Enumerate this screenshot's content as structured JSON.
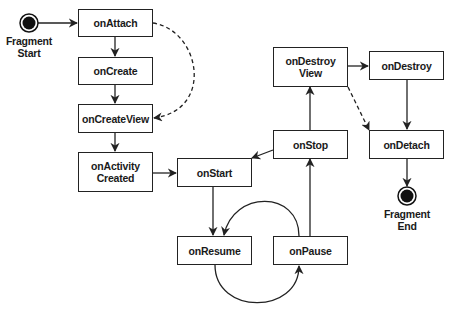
{
  "diagram": {
    "type": "state-lifecycle",
    "start": {
      "label_line1": "Fragment",
      "label_line2": "Start"
    },
    "end": {
      "label_line1": "Fragment",
      "label_line2": "End"
    },
    "nodes": {
      "onAttach": {
        "label": "onAttach"
      },
      "onCreate": {
        "label": "onCreate"
      },
      "onCreateView": {
        "label": "onCreateView"
      },
      "onActivityCreated": {
        "label_line1": "onActivity",
        "label_line2": "Created"
      },
      "onStart": {
        "label": "onStart"
      },
      "onResume": {
        "label": "onResume"
      },
      "onPause": {
        "label": "onPause"
      },
      "onStop": {
        "label": "onStop"
      },
      "onDestroyView": {
        "label_line1": "onDestroy",
        "label_line2": "View"
      },
      "onDestroy": {
        "label": "onDestroy"
      },
      "onDetach": {
        "label": "onDetach"
      }
    },
    "edges": [
      {
        "from": "start",
        "to": "onAttach",
        "style": "solid"
      },
      {
        "from": "onAttach",
        "to": "onCreate",
        "style": "solid"
      },
      {
        "from": "onAttach",
        "to": "onCreateView",
        "style": "dashed"
      },
      {
        "from": "onCreate",
        "to": "onCreateView",
        "style": "solid"
      },
      {
        "from": "onCreateView",
        "to": "onActivityCreated",
        "style": "solid"
      },
      {
        "from": "onActivityCreated",
        "to": "onStart",
        "style": "solid"
      },
      {
        "from": "onStart",
        "to": "onResume",
        "style": "solid"
      },
      {
        "from": "onResume",
        "to": "onPause",
        "style": "solid-curved"
      },
      {
        "from": "onPause",
        "to": "onResume",
        "style": "solid-curved"
      },
      {
        "from": "onPause",
        "to": "onStop",
        "style": "solid"
      },
      {
        "from": "onStop",
        "to": "onStart",
        "style": "solid"
      },
      {
        "from": "onStop",
        "to": "onDestroyView",
        "style": "solid"
      },
      {
        "from": "onDestroyView",
        "to": "onDestroy",
        "style": "solid"
      },
      {
        "from": "onDestroyView",
        "to": "onDetach",
        "style": "dashed"
      },
      {
        "from": "onDestroy",
        "to": "onDetach",
        "style": "solid"
      },
      {
        "from": "onDetach",
        "to": "end",
        "style": "solid"
      }
    ],
    "colors": {
      "stroke": "#222222",
      "fill": "#ffffff",
      "terminal": "#111111"
    }
  }
}
